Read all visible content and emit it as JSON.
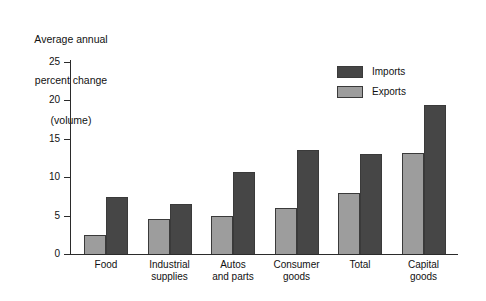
{
  "chart_data": {
    "type": "bar",
    "title": "Average annual percent change (volume)",
    "title_lines": [
      "Average annual",
      "percent change",
      "(volume)"
    ],
    "xlabel": "",
    "ylabel": "",
    "ylim": [
      0,
      25
    ],
    "yticks": [
      0,
      5,
      10,
      15,
      20,
      25
    ],
    "ytick_labels": [
      "0",
      "5",
      "10",
      "15",
      "20",
      "25"
    ],
    "grid": false,
    "legend_position": "upper right",
    "categories": [
      "Food",
      "Industrial supplies",
      "Autos and parts",
      "Consumer goods",
      "Total",
      "Capital goods"
    ],
    "category_lines": [
      [
        "Food"
      ],
      [
        "Industrial",
        "supplies"
      ],
      [
        "Autos",
        "and parts"
      ],
      [
        "Consumer",
        "goods"
      ],
      [
        "Total"
      ],
      [
        "Capital",
        "goods"
      ]
    ],
    "series": [
      {
        "name": "Exports",
        "color": "#9d9d9d",
        "values": [
          2.5,
          4.5,
          5.0,
          6.0,
          8.0,
          13.1
        ]
      },
      {
        "name": "Imports",
        "color": "#464646",
        "values": [
          7.4,
          6.5,
          10.7,
          13.5,
          13.0,
          19.4
        ]
      }
    ],
    "legend": [
      {
        "label": "Imports",
        "color": "#464646"
      },
      {
        "label": "Exports",
        "color": "#9d9d9d"
      }
    ]
  },
  "colors": {
    "exports": "#9d9d9d",
    "imports": "#464646",
    "axis": "#2b2b2b",
    "text": "#111111",
    "background": "#ffffff"
  }
}
